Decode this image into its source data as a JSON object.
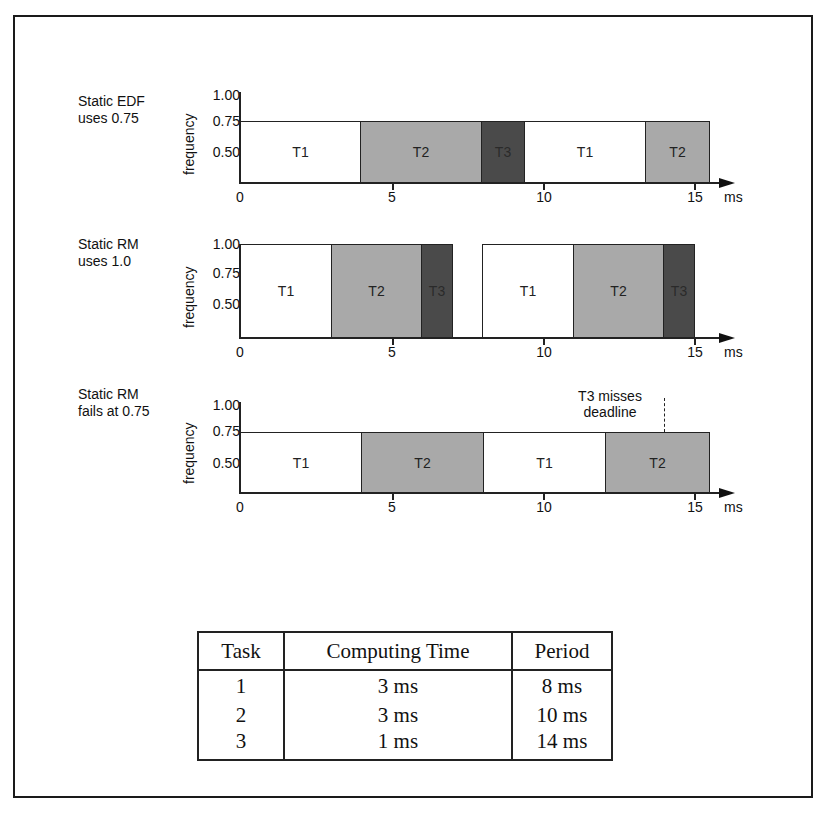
{
  "figure": {
    "rows": [
      {
        "label_line1": "Static EDF",
        "label_line2": "uses 0.75",
        "ylabel": "frequency",
        "yticks": [
          "1.00",
          "0.75",
          "0.50"
        ],
        "xticks": [
          "0",
          "5",
          "10",
          "15"
        ],
        "xunit": "ms",
        "segments": [
          {
            "task": "T1",
            "start": 0,
            "end": 4,
            "freq": 0.75
          },
          {
            "task": "T2",
            "start": 4,
            "end": 8,
            "freq": 0.75
          },
          {
            "task": "T3",
            "start": 8,
            "end": 9.33,
            "freq": 0.75
          },
          {
            "task": "T1",
            "start": 9.33,
            "end": 13.33,
            "freq": 0.75
          },
          {
            "task": "T2",
            "start": 13.33,
            "end": 15.5,
            "freq": 0.75
          }
        ]
      },
      {
        "label_line1": "Static RM",
        "label_line2": "uses 1.0",
        "ylabel": "frequency",
        "yticks": [
          "1.00",
          "0.75",
          "0.50"
        ],
        "xticks": [
          "0",
          "5",
          "10",
          "15"
        ],
        "xunit": "ms",
        "segments": [
          {
            "task": "T1",
            "start": 0,
            "end": 3,
            "freq": 1.0
          },
          {
            "task": "T2",
            "start": 3,
            "end": 6,
            "freq": 1.0
          },
          {
            "task": "T3",
            "start": 6,
            "end": 7,
            "freq": 1.0
          },
          {
            "task": "T1",
            "start": 8,
            "end": 11,
            "freq": 1.0
          },
          {
            "task": "T2",
            "start": 11,
            "end": 14,
            "freq": 1.0
          },
          {
            "task": "T3",
            "start": 14,
            "end": 15,
            "freq": 1.0
          }
        ]
      },
      {
        "label_line1": "Static RM",
        "label_line2": "fails at 0.75",
        "ylabel": "frequency",
        "yticks": [
          "1.00",
          "0.75",
          "0.50"
        ],
        "xticks": [
          "0",
          "5",
          "10",
          "15"
        ],
        "xunit": "ms",
        "annotation_line1": "T3 misses",
        "annotation_line2": "deadline",
        "annotation_time": 14,
        "segments": [
          {
            "task": "T1",
            "start": 0,
            "end": 4,
            "freq": 0.75
          },
          {
            "task": "T2",
            "start": 4,
            "end": 8,
            "freq": 0.75
          },
          {
            "task": "T1",
            "start": 8,
            "end": 12,
            "freq": 0.75
          },
          {
            "task": "T2",
            "start": 12,
            "end": 15.5,
            "freq": 0.75
          }
        ]
      }
    ],
    "colors": {
      "T1": "#ffffff",
      "T2": "#a9a9a9",
      "T3": "#4a4a4a"
    }
  },
  "table": {
    "headers": [
      "Task",
      "Computing Time",
      "Period"
    ],
    "rows": [
      [
        "1",
        "3 ms",
        "8 ms"
      ],
      [
        "2",
        "3 ms",
        "10 ms"
      ],
      [
        "3",
        "1 ms",
        "14 ms"
      ]
    ]
  }
}
